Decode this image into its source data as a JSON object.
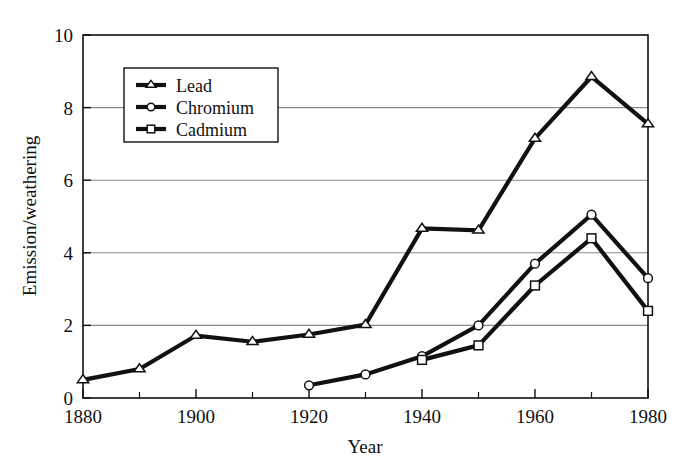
{
  "chart_data": {
    "type": "line",
    "title": "",
    "xlabel": "Year",
    "ylabel": "Emission/weathering",
    "xlim": [
      1880,
      1980
    ],
    "ylim": [
      0,
      10
    ],
    "xticks": [
      1880,
      1900,
      1920,
      1940,
      1960,
      1980
    ],
    "xticklabels": [
      "1880",
      "1900",
      "1920",
      "1940",
      "1960",
      "1980"
    ],
    "xminorticks": [
      1890,
      1910,
      1930,
      1950,
      1970
    ],
    "yticks": [
      0,
      2,
      4,
      6,
      8,
      10
    ],
    "yticklabels": [
      "0",
      "2",
      "4",
      "6",
      "8",
      "10"
    ],
    "grid": "horizontal",
    "legend_position": "upper-left-inside",
    "line_color": "#111111",
    "grid_color": "#8a8a8a",
    "marker_fill": "#ffffff",
    "series": [
      {
        "name": "Lead",
        "marker": "triangle",
        "x": [
          1880,
          1890,
          1900,
          1910,
          1920,
          1930,
          1940,
          1950,
          1960,
          1970,
          1980
        ],
        "values": [
          0.5,
          0.8,
          1.72,
          1.55,
          1.75,
          2.02,
          4.67,
          4.62,
          7.15,
          8.85,
          7.55
        ]
      },
      {
        "name": "Chromium",
        "marker": "circle",
        "x": [
          1920,
          1930,
          1940,
          1950,
          1960,
          1970,
          1980
        ],
        "values": [
          0.35,
          0.65,
          1.15,
          2.0,
          3.7,
          5.05,
          3.3
        ]
      },
      {
        "name": "Cadmium",
        "marker": "square",
        "x": [
          1940,
          1950,
          1960,
          1970,
          1980
        ],
        "values": [
          1.05,
          1.45,
          3.1,
          4.4,
          2.4
        ]
      }
    ]
  },
  "legend": {
    "entries": [
      {
        "label": "Lead"
      },
      {
        "label": "Chromium"
      },
      {
        "label": "Cadmium"
      }
    ]
  }
}
